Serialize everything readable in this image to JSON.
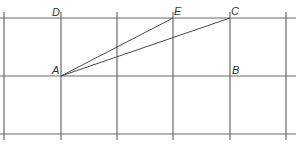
{
  "diagram": {
    "type": "grid-geometry",
    "grid": {
      "columns_x": [
        4,
        61,
        117,
        173,
        230,
        286
      ],
      "rows_y": [
        18,
        76,
        134
      ],
      "line_color": "#6a6a6a"
    },
    "points": {
      "A": {
        "label": "A",
        "x": 61,
        "y": 76
      },
      "B": {
        "label": "B",
        "x": 230,
        "y": 76
      },
      "C": {
        "label": "C",
        "x": 230,
        "y": 18
      },
      "D": {
        "label": "D",
        "x": 61,
        "y": 18
      },
      "E": {
        "label": "E",
        "x": 173,
        "y": 18
      }
    },
    "segments": [
      {
        "from": "A",
        "to": "E"
      },
      {
        "from": "A",
        "to": "C"
      }
    ]
  }
}
